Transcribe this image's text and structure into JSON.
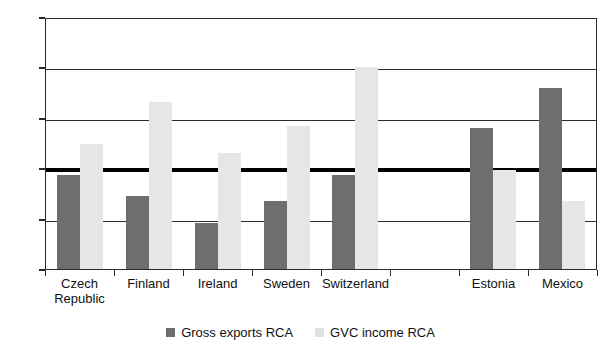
{
  "chart_data": {
    "type": "bar",
    "title": "",
    "subtitle": "",
    "xlabel": "",
    "ylabel": "",
    "ylim": [
      0.0,
      2.5
    ],
    "yticks": [
      "0.0",
      "0.5",
      "1.0",
      "1.5",
      "2.0",
      "2.5"
    ],
    "ytick_values": [
      0.0,
      0.5,
      1.0,
      1.5,
      2.0,
      2.5
    ],
    "grid": true,
    "legend_position": "bottom",
    "reference_line": 1.0,
    "categories": [
      "Czech\nRepublic",
      "Finland",
      "Ireland",
      "Sweden",
      "Switzerland",
      "",
      "Estonia",
      "Mexico"
    ],
    "series": [
      {
        "name": "Gross exports RCA",
        "color": "#6e6e6e",
        "values": [
          0.93,
          0.72,
          0.46,
          0.67,
          0.93,
          null,
          1.4,
          1.8
        ]
      },
      {
        "name": "GVC income RCA",
        "color": "#e6e6e6",
        "values": [
          1.24,
          1.66,
          1.15,
          1.42,
          2.0,
          null,
          0.98,
          0.67
        ]
      }
    ]
  },
  "legend": {
    "items": [
      {
        "label": "Gross exports RCA",
        "swatch": "dark"
      },
      {
        "label": "GVC income RCA",
        "swatch": "light"
      }
    ]
  }
}
